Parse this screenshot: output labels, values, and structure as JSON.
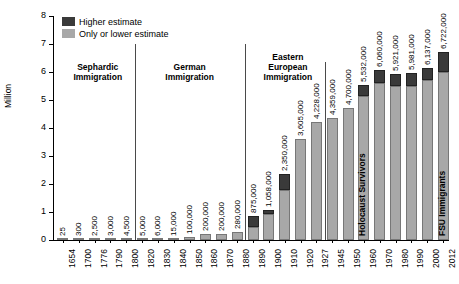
{
  "chart_data": {
    "type": "bar",
    "title": "",
    "xlabel": "",
    "ylabel": "Million",
    "ylim": [
      0,
      8
    ],
    "yticks": [
      "0",
      "1",
      "2",
      "3",
      "4",
      "5",
      "6",
      "7",
      "8"
    ],
    "grid": false,
    "legend_position": "top-left",
    "legend": [
      {
        "label": "Higher estimate",
        "color": "#3a3a3a"
      },
      {
        "label": "Only or lower estimate",
        "color": "#a8a8a8"
      }
    ],
    "categories": [
      "1654",
      "1700",
      "1776",
      "1790",
      "1800",
      "1820",
      "1830",
      "1840",
      "1850",
      "1860",
      "1870",
      "1880",
      "1890",
      "1900",
      "1910",
      "1920",
      "1927",
      "1945",
      "1950",
      "1960",
      "1970",
      "1980",
      "1990",
      "2000",
      "2012"
    ],
    "series": [
      {
        "name": "Only or lower estimate",
        "values": [
          25,
          300,
          2500,
          3000,
          4500,
          5000,
          6000,
          15000,
          100000,
          200000,
          200000,
          280000,
          450000,
          937000,
          1800000,
          3605000,
          4228000,
          4359000,
          4700000,
          5150000,
          5600000,
          5500000,
          5515000,
          5700000,
          6000000
        ]
      },
      {
        "name": "Higher estimate",
        "values": [
          25,
          300,
          2500,
          3000,
          4500,
          5000,
          6000,
          15000,
          100000,
          200000,
          200000,
          280000,
          875000,
          1058000,
          2350000,
          3605000,
          4228000,
          4359000,
          4700000,
          5532000,
          6060000,
          5921000,
          5981000,
          6137000,
          6722000
        ]
      }
    ],
    "data_labels": [
      "25",
      "300",
      "2,500",
      "3,000",
      "4,500",
      "5,000",
      "6,000",
      "15,000",
      "100,000",
      "200,000",
      "200,000",
      "280,000",
      "875,000",
      "1,058,000",
      "2,350,000",
      "3,605,000",
      "4,228,000",
      "4,359,000",
      "4,700,000",
      "5,532,000",
      "6,060,000",
      "5,921,000",
      "5,981,000",
      "6,137,000",
      "6,722,000"
    ],
    "group_labels": [
      {
        "text": "Sephardic\nImmigration"
      },
      {
        "text": "German\nImmigration"
      },
      {
        "text": "Eastern\nEuropean\nImmigration"
      }
    ],
    "bar_annotations": [
      {
        "category": "1960",
        "text": "Holocaust Survivors"
      },
      {
        "category": "2012",
        "text": "FSU Immigrants"
      }
    ]
  }
}
